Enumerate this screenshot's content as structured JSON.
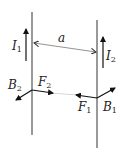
{
  "diagram": {
    "type": "physics-parallel-currents",
    "wires": [
      {
        "id": "wire-1",
        "x": 32,
        "y1": 12,
        "y2": 135
      },
      {
        "id": "wire-2",
        "x": 97,
        "y1": 20,
        "y2": 148
      }
    ],
    "labels": {
      "I1": {
        "base": "I",
        "sub": "1"
      },
      "I2": {
        "base": "I",
        "sub": "2"
      },
      "a": "a",
      "F1": {
        "base": "F",
        "sub": "1"
      },
      "F2": {
        "base": "F",
        "sub": "2"
      },
      "B1": {
        "base": "B",
        "sub": "1"
      },
      "B2": {
        "base": "B",
        "sub": "2"
      }
    },
    "colors": {
      "wire": "#555555",
      "arrow": "#111111",
      "distance_line": "#777777",
      "force_line": "#aaaaaa"
    }
  }
}
